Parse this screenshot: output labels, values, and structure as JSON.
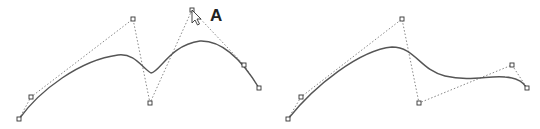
{
  "figures": [
    {
      "id": "left",
      "control_points": [
        [
          19,
          119
        ],
        [
          31,
          97
        ],
        [
          133,
          19
        ],
        [
          150,
          103
        ],
        [
          192,
          10
        ],
        [
          244,
          65
        ],
        [
          259,
          88
        ]
      ],
      "curve_path": "M19,119 C40,90 80,60 118,55 C135,53 142,68 151,73 C160,72 170,45 200,41 C225,40 245,65 259,88",
      "label": "A",
      "label_pos": [
        210,
        6
      ],
      "cursor_pos": [
        192,
        10
      ]
    },
    {
      "id": "right",
      "control_points": [
        [
          288,
          119
        ],
        [
          301,
          97
        ],
        [
          402,
          19
        ],
        [
          419,
          103
        ],
        [
          512,
          65
        ],
        [
          527,
          88
        ]
      ],
      "curve_path": "M288,119 C315,85 360,50 392,47 C415,47 420,70 445,76 C470,82 490,75 505,77 C520,78 524,84 527,88"
    }
  ],
  "colors": {
    "curve": "#555555",
    "control_line": "#888888",
    "handle_stroke": "#333333"
  }
}
